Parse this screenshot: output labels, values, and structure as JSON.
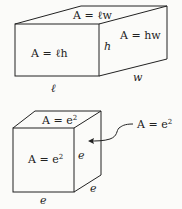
{
  "box": {
    "top_face_label": "A = ℓw",
    "front_face_label": "A = ℓh",
    "side_face_label": "A = hw",
    "height_label": "h",
    "width_label": "w",
    "length_label": "ℓ"
  },
  "cube": {
    "top_face_label": "A = e",
    "top_face_exp": "2",
    "front_face_label": "A = e",
    "front_face_exp": "2",
    "callout_label": "A = e",
    "callout_exp": "2",
    "edge_right_label": "e",
    "edge_depth_label": "e",
    "edge_bottom_label": "e"
  },
  "colors": {
    "stroke": "#222222",
    "background": "#fbfbf9"
  }
}
